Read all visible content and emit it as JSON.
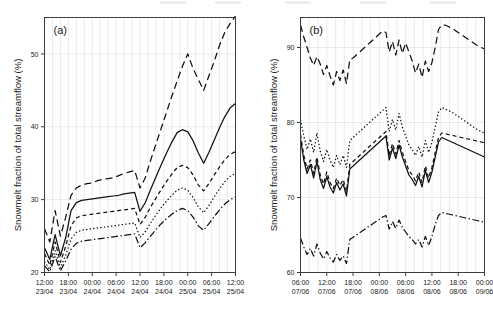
{
  "figure": {
    "background": "#ffffff",
    "line_color": "#111111",
    "grid_color": "#e2e2e8",
    "axis_color": "#3c3c3c",
    "cropped_legend_note": "legend row partially cut off at top of image"
  },
  "legend_strip": {
    "visible": true,
    "entries": [
      "",
      "",
      "",
      ""
    ]
  },
  "chart_data": [
    {
      "type": "line",
      "panel": "a",
      "tag": "(a)",
      "title": "",
      "xlabel": "",
      "ylabel": "Snowmelt fraction of total streamflow (%)",
      "ylim": [
        20,
        55
      ],
      "yticks": [
        20,
        30,
        40,
        50
      ],
      "ytick_labels": [
        "20",
        "30",
        "40",
        "50"
      ],
      "grid": true,
      "legend_position": "top-outside",
      "x_index_range": [
        0,
        36
      ],
      "xticks": [
        0,
        4.5,
        9,
        13.5,
        18,
        22.5,
        27,
        31.5,
        36
      ],
      "xtick_labels": [
        "12:00\n23/04",
        "18:00\n23/04",
        "00:00\n24/04",
        "06:00\n24/04",
        "12:00\n24/04",
        "18:00\n24/04",
        "00:00\n25/04",
        "06:00\n25/04",
        "12:00\n25/04"
      ],
      "xtick_times": [
        "12:00",
        "18:00",
        "00:00",
        "06:00",
        "12:00",
        "18:00",
        "00:00",
        "06:00",
        "12:00"
      ],
      "xtick_dates": [
        "23/04",
        "23/04",
        "24/04",
        "24/04",
        "24/04",
        "24/04",
        "25/04",
        "25/04",
        "25/04"
      ],
      "minor_gridlines_per_major": 2,
      "series": [
        {
          "name": "series-dashed",
          "style": "dashed",
          "dasharray": "7,4",
          "values": [
            26.0,
            24.2,
            28.5,
            25.0,
            27.6,
            30.6,
            31.6,
            32.0,
            32.2,
            32.3,
            32.6,
            32.8,
            32.9,
            33.0,
            33.3,
            33.6,
            33.8,
            34.0,
            31.6,
            33.0,
            35.4,
            37.6,
            39.8,
            42.0,
            44.2,
            46.3,
            48.3,
            50.0,
            48.0,
            46.5,
            45.0,
            47.0,
            49.0,
            51.2,
            53.0,
            54.2,
            55.2
          ]
        },
        {
          "name": "series-solid",
          "style": "solid",
          "dasharray": "none",
          "values": [
            23.4,
            21.8,
            25.2,
            22.3,
            24.8,
            28.5,
            29.6,
            29.9,
            30.0,
            30.1,
            30.2,
            30.3,
            30.4,
            30.5,
            30.6,
            30.8,
            30.9,
            31.0,
            28.4,
            29.6,
            31.4,
            33.1,
            34.8,
            36.4,
            37.9,
            39.2,
            39.6,
            39.3,
            38.1,
            36.4,
            35.0,
            36.5,
            38.2,
            39.9,
            41.4,
            42.6,
            43.2
          ]
        },
        {
          "name": "series-shortdash",
          "style": "short-dash",
          "dasharray": "4,3",
          "values": [
            22.6,
            21.0,
            24.2,
            21.4,
            23.6,
            26.4,
            27.5,
            27.8,
            27.9,
            28.0,
            28.1,
            28.2,
            28.3,
            28.4,
            28.5,
            28.6,
            28.7,
            28.8,
            26.6,
            27.6,
            29.0,
            30.2,
            31.4,
            32.5,
            33.5,
            34.4,
            34.7,
            34.4,
            33.4,
            32.0,
            31.2,
            32.2,
            33.4,
            34.5,
            35.5,
            36.2,
            36.6
          ]
        },
        {
          "name": "series-dotted",
          "style": "dotted",
          "dasharray": "1.4,2.2",
          "values": [
            21.5,
            20.4,
            23.0,
            20.6,
            22.4,
            24.6,
            25.5,
            25.8,
            25.9,
            26.0,
            26.1,
            26.2,
            26.3,
            26.4,
            26.5,
            26.6,
            26.7,
            26.8,
            24.8,
            25.6,
            26.8,
            27.9,
            28.9,
            29.8,
            30.6,
            31.3,
            31.6,
            31.3,
            30.3,
            29.0,
            28.2,
            29.2,
            30.4,
            31.5,
            32.5,
            33.2,
            33.6
          ]
        },
        {
          "name": "series-dashdot",
          "style": "dash-dot",
          "dasharray": "7,2.5,1.4,2.5",
          "values": [
            20.9,
            20.1,
            22.2,
            20.2,
            21.6,
            23.2,
            24.0,
            24.3,
            24.4,
            24.5,
            24.6,
            24.7,
            24.8,
            24.9,
            25.0,
            25.1,
            25.2,
            25.3,
            23.4,
            24.1,
            25.0,
            25.9,
            26.7,
            27.4,
            28.0,
            28.5,
            28.8,
            28.5,
            27.6,
            26.4,
            25.8,
            26.7,
            27.7,
            28.6,
            29.4,
            30.0,
            30.4
          ]
        }
      ]
    },
    {
      "type": "line",
      "panel": "b",
      "tag": "(b)",
      "title": "",
      "xlabel": "",
      "ylabel": "Snowmelt fraction of total streamflow (%)",
      "ylim": [
        60,
        94
      ],
      "yticks": [
        60,
        70,
        80,
        90
      ],
      "ytick_labels": [
        "60",
        "70",
        "80",
        "90"
      ],
      "grid": true,
      "legend_position": "top-outside",
      "x_index_range": [
        0,
        56
      ],
      "xticks": [
        0,
        8,
        16,
        24,
        32,
        40,
        48,
        56
      ],
      "xtick_labels": [
        "06:00\n07/06",
        "12:00\n07/06",
        "18:00\n07/06",
        "00:00\n08/06",
        "06:00\n08/06",
        "12:00\n08/06",
        "18:00\n08/06",
        "00:00\n09/06"
      ],
      "xtick_times": [
        "06:00",
        "12:00",
        "18:00",
        "00:00",
        "06:00",
        "12:00",
        "18:00",
        "00:00"
      ],
      "xtick_dates": [
        "07/06",
        "07/06",
        "07/06",
        "08/06",
        "08/06",
        "08/06",
        "08/06",
        "09/06"
      ],
      "minor_gridlines_per_major": 2,
      "series": [
        {
          "name": "series-dashed",
          "style": "dashed",
          "dasharray": "7,4",
          "values": [
            93.0,
            91.4,
            90.0,
            88.6,
            87.6,
            88.8,
            87.8,
            86.4,
            87.6,
            86.2,
            85.0,
            86.8,
            85.6,
            87.0,
            85.2,
            88.4,
            88.6,
            89.0,
            89.4,
            89.8,
            90.2,
            90.6,
            91.0,
            91.4,
            91.8,
            92.2,
            92.0,
            89.4,
            90.8,
            89.0,
            91.0,
            89.2,
            90.6,
            89.4,
            88.2,
            86.6,
            87.8,
            86.0,
            88.2,
            86.8,
            88.0,
            90.0,
            92.4,
            93.0,
            93.0,
            92.8,
            92.6,
            92.3,
            92.0,
            91.7,
            91.4,
            91.1,
            90.8,
            90.5,
            90.2,
            90.0,
            89.8
          ]
        },
        {
          "name": "series-dotted",
          "style": "dotted",
          "dasharray": "1.4,2.2",
          "values": [
            80.4,
            78.2,
            76.4,
            77.8,
            76.0,
            78.6,
            76.2,
            74.8,
            76.4,
            75.0,
            74.0,
            75.6,
            74.4,
            75.6,
            74.0,
            77.6,
            78.0,
            78.4,
            78.8,
            79.2,
            79.6,
            80.0,
            80.4,
            80.8,
            81.2,
            81.6,
            82.0,
            78.8,
            80.4,
            79.0,
            81.2,
            79.4,
            78.2,
            77.0,
            76.4,
            75.6,
            76.8,
            75.4,
            77.6,
            76.0,
            77.4,
            79.4,
            81.4,
            82.0,
            81.8,
            81.6,
            81.4,
            81.1,
            80.8,
            80.5,
            80.2,
            79.9,
            79.6,
            79.3,
            79.0,
            78.8,
            78.6
          ]
        },
        {
          "name": "series-solid",
          "style": "solid",
          "dasharray": "none",
          "values": [
            77.8,
            75.0,
            73.2,
            74.4,
            72.6,
            74.8,
            72.4,
            71.2,
            72.8,
            71.4,
            70.6,
            72.0,
            71.0,
            71.8,
            70.2,
            73.8,
            74.2,
            74.6,
            75.0,
            75.4,
            75.8,
            76.2,
            76.6,
            77.0,
            77.4,
            77.8,
            78.2,
            75.0,
            76.6,
            75.2,
            77.0,
            75.4,
            74.2,
            73.0,
            72.4,
            71.6,
            72.8,
            71.4,
            73.6,
            72.0,
            73.4,
            75.4,
            77.4,
            78.0,
            77.8,
            77.6,
            77.4,
            77.2,
            77.0,
            76.8,
            76.6,
            76.4,
            76.2,
            76.0,
            75.8,
            75.6,
            75.4
          ]
        },
        {
          "name": "series-shortdash",
          "style": "short-dash",
          "dasharray": "4,3",
          "values": [
            78.4,
            75.6,
            73.8,
            75.0,
            73.2,
            75.4,
            73.0,
            71.8,
            73.4,
            72.0,
            71.2,
            72.6,
            71.6,
            72.4,
            70.8,
            74.4,
            74.8,
            75.2,
            75.6,
            76.0,
            76.4,
            76.8,
            77.2,
            77.6,
            78.0,
            78.4,
            78.8,
            75.6,
            77.2,
            75.8,
            77.6,
            76.0,
            74.8,
            73.6,
            73.0,
            72.2,
            73.4,
            72.0,
            74.2,
            72.6,
            74.0,
            76.0,
            78.0,
            78.6,
            78.5,
            78.4,
            78.3,
            78.2,
            78.1,
            78.0,
            77.9,
            77.8,
            77.7,
            77.6,
            77.5,
            77.4,
            77.3
          ]
        },
        {
          "name": "series-dashdot",
          "style": "dash-dot",
          "dasharray": "7,2.5,1.4,2.5",
          "values": [
            64.6,
            63.4,
            62.4,
            63.2,
            62.2,
            63.8,
            62.6,
            61.8,
            62.8,
            61.9,
            61.4,
            62.4,
            61.6,
            62.2,
            61.2,
            64.4,
            64.7,
            65.0,
            65.3,
            65.6,
            65.9,
            66.2,
            66.5,
            66.8,
            67.1,
            67.4,
            67.6,
            65.8,
            66.8,
            65.9,
            67.0,
            66.0,
            65.4,
            64.8,
            64.4,
            63.8,
            64.4,
            63.4,
            64.8,
            63.6,
            64.8,
            66.4,
            67.6,
            68.0,
            67.9,
            67.8,
            67.7,
            67.6,
            67.5,
            67.4,
            67.3,
            67.2,
            67.1,
            67.0,
            66.9,
            66.8,
            66.7
          ]
        }
      ]
    }
  ]
}
